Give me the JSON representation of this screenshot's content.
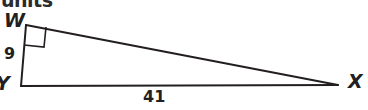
{
  "figure": {
    "heading": "units",
    "background_color": "#ffffff",
    "stroke_color": "#231f20",
    "text_color": "#231f20"
  },
  "triangle": {
    "type": "right-triangle",
    "vertices": [
      {
        "name": "W",
        "label": "W",
        "x": 26,
        "y": 25
      },
      {
        "name": "Y",
        "label": "Y",
        "x": 21,
        "y": 86
      },
      {
        "name": "X",
        "label": "X",
        "x": 338,
        "y": 85
      }
    ],
    "right_angle_at": "W",
    "sides": [
      {
        "name": "WY",
        "label": "9",
        "value": 9,
        "from": "W",
        "to": "Y"
      },
      {
        "name": "YX",
        "label": "41",
        "value": 41,
        "from": "Y",
        "to": "X"
      },
      {
        "name": "WX",
        "label": "",
        "value": null,
        "from": "W",
        "to": "X"
      }
    ]
  },
  "labels": {
    "vertex_w": "W",
    "vertex_y": "Y",
    "vertex_x": "X",
    "leg_measure": "9",
    "base_measure": "41"
  }
}
